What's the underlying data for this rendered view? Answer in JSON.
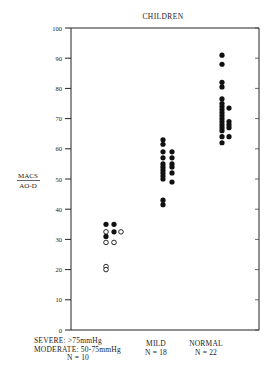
{
  "chart_data": {
    "type": "scatter",
    "title": "CHILDREN",
    "xlabel": "",
    "ylabel": "MACS / AO-D",
    "ylabel_numerator": "MACS",
    "ylabel_denominator": "AO-D",
    "ylim": [
      0,
      100
    ],
    "yticks": [
      0,
      10,
      20,
      30,
      40,
      50,
      60,
      70,
      80,
      90,
      100
    ],
    "grid": false,
    "legend": "none",
    "categories": [
      {
        "key": "severe_moderate",
        "label_lines": [
          "SEVERE: >75mmHg",
          "MODERATE: 50-75mmHg",
          "N = 10"
        ],
        "n": 10
      },
      {
        "key": "mild",
        "label_lines": [
          "MILD",
          "N = 18"
        ],
        "n": 18
      },
      {
        "key": "normal",
        "label_lines": [
          "NORMAL",
          "N = 22"
        ],
        "n": 22
      }
    ],
    "series": [
      {
        "name": "Severe (>75mmHg) - filled",
        "category": "severe_moderate",
        "marker": "filled-circle",
        "points": [
          {
            "col": 0,
            "value": 35
          },
          {
            "col": 1,
            "value": 35
          },
          {
            "col": 1,
            "value": 32.5
          },
          {
            "col": 0,
            "value": 31
          }
        ]
      },
      {
        "name": "Moderate (50-75mmHg) - open",
        "category": "severe_moderate",
        "marker": "open-circle",
        "points": [
          {
            "col": 0,
            "value": 32.5
          },
          {
            "col": 2,
            "value": 32.5
          },
          {
            "col": 0,
            "value": 29
          },
          {
            "col": 1,
            "value": 29
          },
          {
            "col": 0,
            "value": 21
          },
          {
            "col": 0,
            "value": 20
          }
        ]
      },
      {
        "name": "Mild",
        "category": "mild",
        "marker": "filled-circle",
        "points": [
          {
            "col": 0,
            "value": 63
          },
          {
            "col": 0,
            "value": 61.5
          },
          {
            "col": 0,
            "value": 59
          },
          {
            "col": 0,
            "value": 57
          },
          {
            "col": 0,
            "value": 55
          },
          {
            "col": 0,
            "value": 54
          },
          {
            "col": 0,
            "value": 53
          },
          {
            "col": 0,
            "value": 52
          },
          {
            "col": 0,
            "value": 51
          },
          {
            "col": 0,
            "value": 50
          },
          {
            "col": 0,
            "value": 43
          },
          {
            "col": 0,
            "value": 41.5
          },
          {
            "col": 1,
            "value": 59
          },
          {
            "col": 1,
            "value": 57
          },
          {
            "col": 1,
            "value": 55
          },
          {
            "col": 1,
            "value": 54
          },
          {
            "col": 1,
            "value": 52
          },
          {
            "col": 1,
            "value": 49
          }
        ]
      },
      {
        "name": "Normal",
        "category": "normal",
        "marker": "filled-circle",
        "points": [
          {
            "col": 0,
            "value": 91
          },
          {
            "col": 0,
            "value": 88
          },
          {
            "col": 0,
            "value": 82
          },
          {
            "col": 0,
            "value": 80.5
          },
          {
            "col": 0,
            "value": 76.5
          },
          {
            "col": 0,
            "value": 75
          },
          {
            "col": 0,
            "value": 74
          },
          {
            "col": 0,
            "value": 73
          },
          {
            "col": 0,
            "value": 72
          },
          {
            "col": 0,
            "value": 71
          },
          {
            "col": 0,
            "value": 70
          },
          {
            "col": 0,
            "value": 69
          },
          {
            "col": 0,
            "value": 68
          },
          {
            "col": 0,
            "value": 67
          },
          {
            "col": 0,
            "value": 66
          },
          {
            "col": 0,
            "value": 64
          },
          {
            "col": 0,
            "value": 62
          },
          {
            "col": 1,
            "value": 73.5
          },
          {
            "col": 1,
            "value": 69
          },
          {
            "col": 1,
            "value": 68
          },
          {
            "col": 1,
            "value": 67
          },
          {
            "col": 1,
            "value": 64
          }
        ]
      }
    ]
  },
  "layout_hints": {
    "category_x": {
      "severe_moderate": [
        106,
        114,
        121
      ],
      "mild": [
        163,
        172
      ],
      "normal": [
        222,
        229
      ]
    }
  },
  "labels": {
    "title": "CHILDREN",
    "ylabel_num": "MACS",
    "ylabel_den": "AO-D",
    "cat_severe_1": "SEVERE: >75mmHg",
    "cat_severe_2": "MODERATE: 50-75mmHg",
    "cat_severe_3": "N = 10",
    "cat_mild_1": "MILD",
    "cat_mild_2": "N = 18",
    "cat_normal_1": "NORMAL",
    "cat_normal_2": "N = 22"
  }
}
